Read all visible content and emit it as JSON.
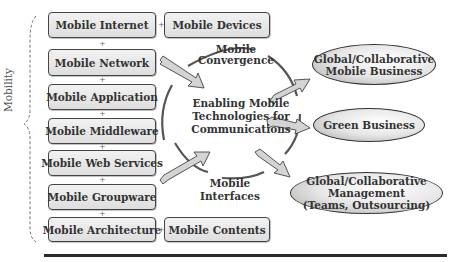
{
  "diagram": {
    "side_label": "Mobility",
    "connector": "+",
    "left_column": [
      {
        "label": "Mobile Internet"
      },
      {
        "label": "Mobile Network"
      },
      {
        "label": "Mobile Application"
      },
      {
        "label": "Mobile Middleware"
      },
      {
        "label": "Mobile Web Services"
      },
      {
        "label": "Mobile Groupware"
      },
      {
        "label": "Mobile Architecture"
      }
    ],
    "right_column": [
      {
        "label": "Mobile Devices"
      },
      {
        "label": "Mobile Contents"
      }
    ],
    "center": {
      "top_label_line1": "Mobile",
      "top_label_line2": "Convergence",
      "core_line1": "Enabling Mobile",
      "core_line2": "Technologies for",
      "core_line3": "Communications",
      "bottom_label_line1": "Mobile",
      "bottom_label_line2": "Interfaces"
    },
    "outcomes": [
      {
        "line1": "Global/Collaborative",
        "line2": "Mobile Business"
      },
      {
        "line1": "Green Business"
      },
      {
        "line1": "Global/Collaborative",
        "line2": "Management",
        "line3": "(Teams, Outsourcing)"
      }
    ],
    "colors": {
      "box_fill": "#e8e8e8",
      "box_border": "#444444",
      "arrow_fill": "#d0d0d0",
      "arc_stroke": "#555555",
      "rule": "#2a2a2a"
    }
  }
}
